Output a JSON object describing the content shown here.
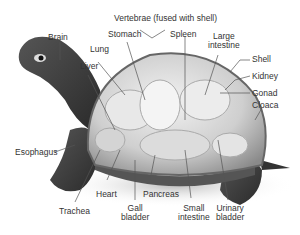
{
  "diagram": {
    "labels": {
      "brain": "Brain",
      "vertebrae_1": "Vertebrae (fused with shell)",
      "stomach": "Stomach",
      "spleen": "Spleen",
      "lung": "Lung",
      "liver": "Liver",
      "large_intestine_1": "Large",
      "large_intestine_2": "intestine",
      "shell": "Shell",
      "kidney": "Kidney",
      "gonad": "Gonad",
      "cloaca": "Cloaca",
      "esophagus": "Esophagus",
      "heart": "Heart",
      "pancreas": "Pancreas",
      "trachea": "Trachea",
      "gall_bladder_1": "Gall",
      "gall_bladder_2": "bladder",
      "small_intestine_1": "Small",
      "small_intestine_2": "intestine",
      "urinary_bladder_1": "Urinary",
      "urinary_bladder_2": "bladder"
    }
  }
}
